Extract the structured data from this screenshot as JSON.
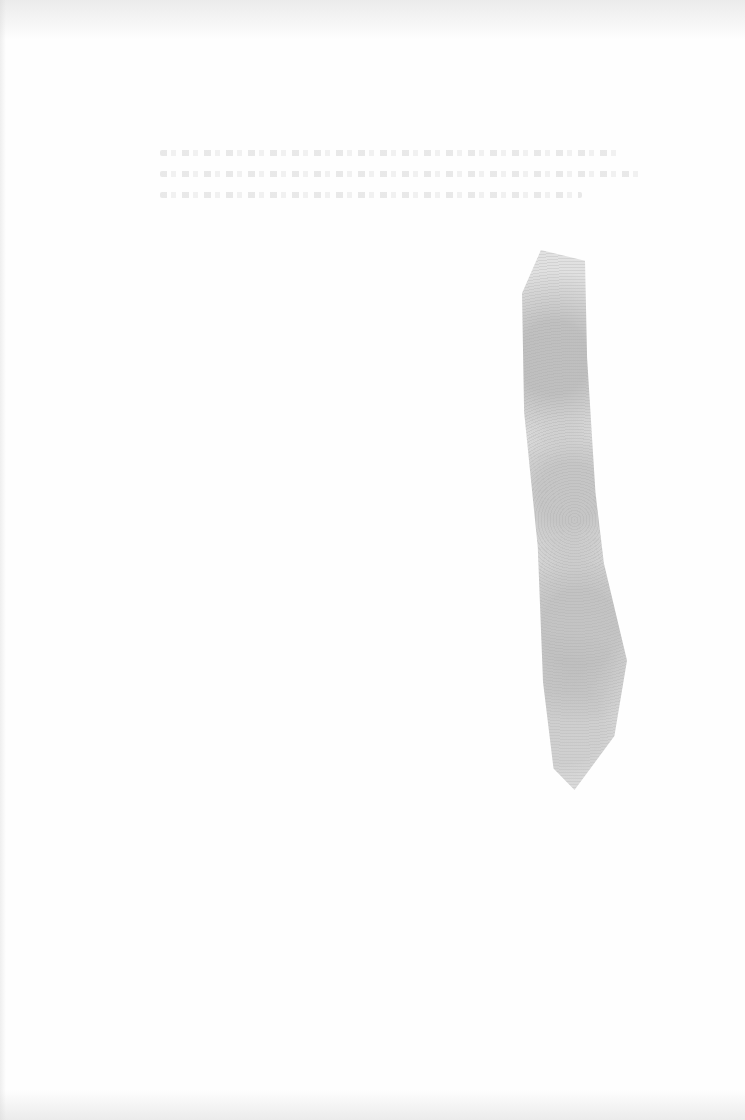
{
  "page": {
    "type": "blank scanned page",
    "background_color": "#fefefe",
    "smudge_color": "#b4b4b4",
    "ghost_text_lines": 3
  }
}
